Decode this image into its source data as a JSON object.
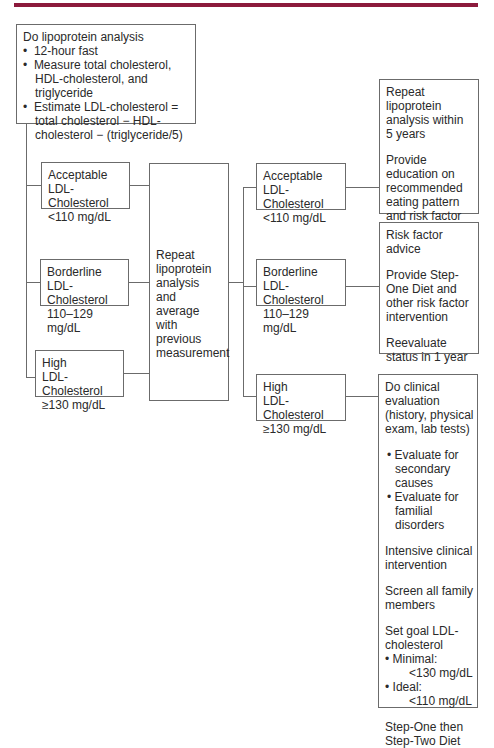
{
  "accent_color": "#8c1a3c",
  "start": {
    "title": "Do lipoprotein analysis",
    "bullets": [
      "12-hour fast",
      "Measure total cholesterol, HDL-cholesterol, and triglyceride",
      "Estimate LDL-cholesterol = total cholesterol − HDL-cholesterol − (triglyceride/5)"
    ],
    "bullet_glyph": "•"
  },
  "first_level": [
    {
      "category": "Acceptable",
      "measure": "LDL-Cholesterol",
      "range": "<110 mg/dL"
    },
    {
      "category": "Borderline",
      "measure": "LDL-Cholesterol",
      "range": "110–129 mg/dL"
    },
    {
      "category": "High",
      "measure": "LDL-Cholesterol",
      "range": "≥130 mg/dL"
    }
  ],
  "repeat_box": {
    "text": "Repeat lipoprotein analysis and average with previous measurement"
  },
  "second_level": [
    {
      "category": "Acceptable",
      "measure": "LDL-Cholesterol",
      "range": "<110 mg/dL"
    },
    {
      "category": "Borderline",
      "measure": "LDL-Cholesterol",
      "range": "110–129 mg/dL"
    },
    {
      "category": "High",
      "measure": "LDL-Cholesterol",
      "range": "≥130 mg/dL"
    }
  ],
  "actions": {
    "acceptable": [
      "Repeat lipoprotein analysis within 5 years",
      "Provide education on recommended eating pattern and risk factor reduction"
    ],
    "borderline": [
      "Risk factor advice",
      "Provide Step-One Diet and other risk factor intervention",
      "Reevaluate status in 1 year"
    ],
    "high": {
      "evaluation": "Do clinical evaluation (history, physical exam, lab tests)",
      "eval_bullets": [
        "Evaluate for secondary causes",
        "Evaluate for familial disorders"
      ],
      "intervention": "Intensive clinical intervention",
      "screen": "Screen all family members",
      "goal_title": "Set goal LDL-cholesterol",
      "goal_minimal_label": "Minimal:",
      "goal_minimal_value": "<130 mg/dL",
      "goal_ideal_label": "Ideal:",
      "goal_ideal_value": "<110 mg/dL",
      "diet": "Step-One then Step-Two Diet"
    }
  }
}
